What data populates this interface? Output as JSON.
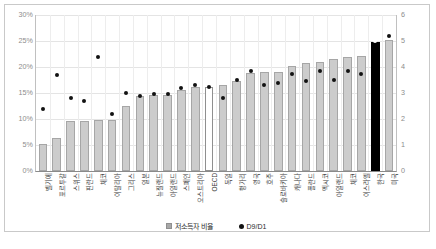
{
  "chart_data": {
    "type": "bar",
    "title": "",
    "subtitle": "",
    "xlabel": "",
    "ylabel": "",
    "y2label": "",
    "ylim": [
      0,
      0.3
    ],
    "y2lim": [
      0,
      6
    ],
    "grid": true,
    "legend_position": "bottom",
    "ytick_labels_left": [
      "0%",
      "5%",
      "10%",
      "15%",
      "20%",
      "25%",
      "30%"
    ],
    "ytick_values_left": [
      0,
      5,
      10,
      15,
      20,
      25,
      30
    ],
    "ytick_labels_right": [
      "0",
      "1",
      "2",
      "3",
      "4",
      "5",
      "6"
    ],
    "ytick_values_right": [
      0,
      1,
      2,
      3,
      4,
      5,
      6
    ],
    "categories": [
      "벨기에",
      "포르투갈",
      "스위스",
      "핀란드",
      "체코",
      "이탈리아",
      "그리스",
      "일본",
      "뉴질랜드",
      "아일랜드",
      "스페인",
      "오스트리아",
      "OECD",
      "독일",
      "헝가리",
      "영국",
      "호주",
      "슬로바키아",
      "캐나다",
      "폴란드",
      "멕시코",
      "아일랜드",
      "체코",
      "이스라엘",
      "한국",
      "미국"
    ],
    "series": [
      {
        "name": "저소득자 비율",
        "axis": "left",
        "unit": "%",
        "values": [
          5.2,
          6.3,
          9.6,
          9.6,
          9.8,
          9.9,
          12.5,
          14.4,
          14.6,
          14.6,
          15.5,
          16.1,
          16.2,
          16.6,
          17.4,
          18.9,
          19.0,
          19.0,
          20.1,
          20.7,
          20.9,
          21.6,
          21.9,
          22.1,
          24.9,
          25.1
        ]
      },
      {
        "name": "D9/D1",
        "axis": "right",
        "unit": "",
        "values": [
          2.4,
          3.7,
          2.8,
          2.7,
          4.4,
          2.2,
          3.0,
          2.9,
          2.95,
          2.95,
          3.2,
          3.3,
          3.25,
          2.8,
          3.5,
          3.85,
          3.3,
          3.4,
          3.75,
          3.45,
          3.85,
          3.5,
          3.85,
          3.75,
          5.0,
          5.2
        ]
      }
    ]
  },
  "legend": {
    "items": [
      {
        "label": "저소득자 비율",
        "marker": "square",
        "color": "#a8a8a8"
      },
      {
        "label": "D9/D1",
        "marker": "circle",
        "color": "#121212"
      }
    ]
  },
  "colors": {
    "bar": "#cccccc",
    "bar_border": "#a6a6a6",
    "highlight_bar": "#000000",
    "hollow_bar": "#ffffff",
    "dot": "#121212",
    "grid": "#e4e4e4",
    "axis": "#8a8a8a",
    "tick_text": "#8c8c8c"
  },
  "highlight": {
    "index": 24,
    "category": "한국",
    "style": "black-filled",
    "dot_style": "white"
  },
  "hollow": {
    "index": 12,
    "category": "OECD",
    "style": "white-filled"
  }
}
